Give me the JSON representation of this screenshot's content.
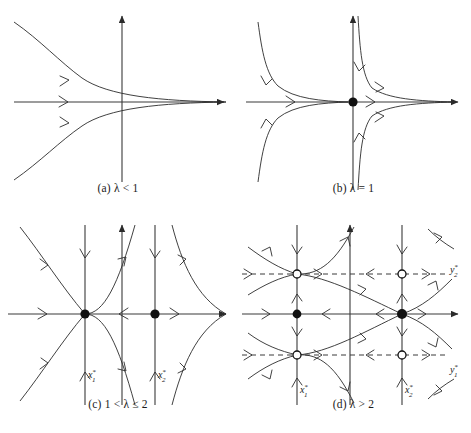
{
  "figure": {
    "background": "#ffffff",
    "stroke_color": "#2b2b2b",
    "axis_color": "#3a3a3a",
    "width": 471,
    "height": 433
  },
  "panels": [
    {
      "id": "a",
      "caption": "(a) λ < 1",
      "lambda_condition": "λ < 1",
      "fixed_points_filled": 0,
      "fixed_points_open": 0,
      "has_dashed_nullclines": false,
      "axis_labels": [],
      "description": "Two curves converging to the right along the horizontal axis"
    },
    {
      "id": "b",
      "caption": "(b) λ = 1",
      "lambda_condition": "λ = 1",
      "fixed_points_filled": 1,
      "fixed_points_open": 0,
      "has_dashed_nullclines": false,
      "axis_labels": [],
      "description": "Degenerate saddle-node at the origin with four hyperbolic branches"
    },
    {
      "id": "c",
      "caption": "(c) 1 < λ ≤ 2",
      "lambda_condition": "1 < λ ≤ 2",
      "fixed_points_filled": 2,
      "fixed_points_open": 0,
      "has_dashed_nullclines": false,
      "axis_labels": [
        "x1*",
        "x2*"
      ],
      "description": "Two fixed points on the horizontal axis with vertical nullclines"
    },
    {
      "id": "d",
      "caption": "(d) λ > 2",
      "lambda_condition": "λ > 2",
      "fixed_points_filled": 2,
      "fixed_points_open": 4,
      "has_dashed_nullclines": true,
      "axis_labels": [
        "x1*",
        "x2*",
        "y1*",
        "y2*"
      ],
      "description": "Six fixed points: two saddles on the axis and four open points on dashed horizontal nullclines"
    }
  ],
  "labels": {
    "x1": {
      "base": "x",
      "sub": "1",
      "sup": "*"
    },
    "x2": {
      "base": "x",
      "sub": "2",
      "sup": "*"
    },
    "y1": {
      "base": "y",
      "sub": "1",
      "sup": "*"
    },
    "y2": {
      "base": "y",
      "sub": "2",
      "sup": "*"
    }
  },
  "captions": {
    "a": "(a) λ < 1",
    "b": "(b) λ = 1",
    "c": "(c) 1 < λ ≤ 2",
    "d": "(d) λ > 2"
  }
}
